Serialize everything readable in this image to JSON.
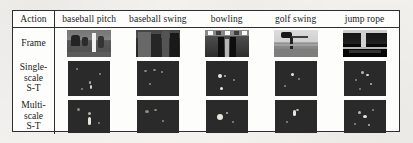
{
  "figure": {
    "caption": "",
    "row_header_label": "Action",
    "columns": [
      {
        "key": "baseball_pitch",
        "label": "baseball pitch"
      },
      {
        "key": "baseball_swing",
        "label": "baseball swing"
      },
      {
        "key": "bowling",
        "label": "bowling"
      },
      {
        "key": "golf_swing",
        "label": "golf swing"
      },
      {
        "key": "jump_rope",
        "label": "jump rope"
      }
    ],
    "rows": [
      {
        "key": "frame",
        "label_lines": [
          "Frame"
        ],
        "cells": [
          {
            "type": "photo",
            "alt": "baseball pitch video frame"
          },
          {
            "type": "photo",
            "alt": "baseball swing video frame"
          },
          {
            "type": "photo",
            "alt": "bowling video frame"
          },
          {
            "type": "photo",
            "alt": "golf swing video frame"
          },
          {
            "type": "photo",
            "alt": "jump rope video frame"
          }
        ]
      },
      {
        "key": "single_scale_st",
        "label_lines": [
          "Single-",
          "scale",
          "S-T"
        ],
        "cells": [
          {
            "type": "feature-map",
            "alt": "single-scale spatio-temporal interest points, baseball pitch"
          },
          {
            "type": "feature-map",
            "alt": "single-scale spatio-temporal interest points, baseball swing"
          },
          {
            "type": "feature-map",
            "alt": "single-scale spatio-temporal interest points, bowling"
          },
          {
            "type": "feature-map",
            "alt": "single-scale spatio-temporal interest points, golf swing"
          },
          {
            "type": "feature-map",
            "alt": "single-scale spatio-temporal interest points, jump rope"
          }
        ]
      },
      {
        "key": "multi_scale_st",
        "label_lines": [
          "Multi-",
          "scale",
          "S-T"
        ],
        "cells": [
          {
            "type": "feature-map",
            "alt": "multi-scale spatio-temporal interest points, baseball pitch"
          },
          {
            "type": "feature-map",
            "alt": "multi-scale spatio-temporal interest points, baseball swing"
          },
          {
            "type": "feature-map",
            "alt": "multi-scale spatio-temporal interest points, bowling"
          },
          {
            "type": "feature-map",
            "alt": "multi-scale spatio-temporal interest points, golf swing"
          },
          {
            "type": "feature-map",
            "alt": "multi-scale spatio-temporal interest points, jump rope"
          }
        ]
      }
    ],
    "colors": {
      "page_background": "#f3f2ef",
      "table_background": "#fdfdfc",
      "border": "#2e2e2e",
      "text": "#1a1a1a",
      "feature_map_background": "#2a2a2a",
      "interest_point": "#e8e6de"
    }
  }
}
